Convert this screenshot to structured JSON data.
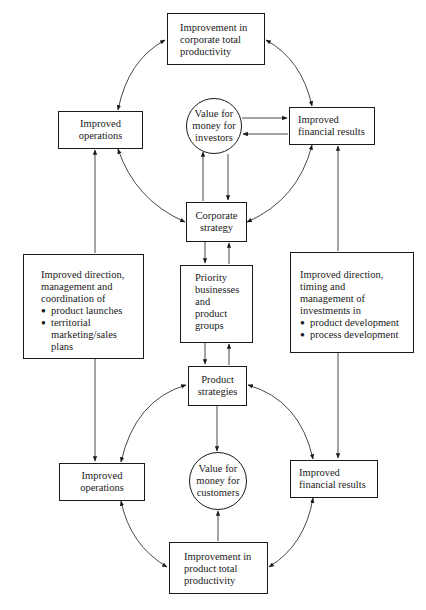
{
  "diagram": {
    "type": "flow-diagram",
    "nodes": {
      "corporate_productivity": {
        "label": "Improvement in\ncorporate total\nproductivity"
      },
      "ops_top": {
        "label": "Improved\noperations"
      },
      "value_investors": {
        "label": "Value for\nmoney for\ninvestors"
      },
      "fin_top": {
        "label": "Improved\nfinancial results"
      },
      "corporate_strategy": {
        "label": "Corporate\nstrategy"
      },
      "left_direction": {
        "label": "Improved direction,\nmanagement and\ncoordination of",
        "bullets": [
          "product launches",
          "territorial\nmarketing/sales\nplans"
        ]
      },
      "priority": {
        "label": "Priority\nbusinesses\nand\nproduct\ngroups"
      },
      "right_direction": {
        "label": "Improved direction,\ntiming and\nmanagement of\ninvestments in",
        "bullets": [
          "product development",
          "process development"
        ]
      },
      "product_strategies": {
        "label": "Product\nstrategies"
      },
      "ops_bottom": {
        "label": "Improved\noperations"
      },
      "value_customers": {
        "label": "Value for\nmoney for\ncustomers"
      },
      "fin_bottom": {
        "label": "Improved\nfinancial results"
      },
      "product_productivity": {
        "label": "Improvement in\nproduct total\nproductivity"
      }
    },
    "edges": [
      {
        "from": "corporate_productivity",
        "to": "ops_top",
        "type": "bidirectional-curve"
      },
      {
        "from": "corporate_productivity",
        "to": "fin_top",
        "type": "bidirectional-curve"
      },
      {
        "from": "ops_top",
        "to": "corporate_strategy",
        "type": "bidirectional-curve"
      },
      {
        "from": "fin_top",
        "to": "corporate_strategy",
        "type": "bidirectional-curve"
      },
      {
        "from": "value_investors",
        "to": "fin_top",
        "type": "arrow"
      },
      {
        "from": "fin_top",
        "to": "value_investors",
        "type": "arrow"
      },
      {
        "from": "corporate_strategy",
        "to": "value_investors",
        "type": "arrow"
      },
      {
        "from": "value_investors",
        "to": "corporate_strategy",
        "type": "arrow"
      },
      {
        "from": "corporate_strategy",
        "to": "priority",
        "type": "arrow"
      },
      {
        "from": "priority",
        "to": "corporate_strategy",
        "type": "arrow"
      },
      {
        "from": "priority",
        "to": "product_strategies",
        "type": "arrow"
      },
      {
        "from": "product_strategies",
        "to": "priority",
        "type": "arrow"
      },
      {
        "from": "left_direction",
        "to": "ops_top",
        "type": "arrow"
      },
      {
        "from": "left_direction",
        "to": "ops_bottom",
        "type": "arrow"
      },
      {
        "from": "right_direction",
        "to": "fin_top",
        "type": "arrow"
      },
      {
        "from": "right_direction",
        "to": "fin_bottom",
        "type": "arrow"
      },
      {
        "from": "product_strategies",
        "to": "ops_bottom",
        "type": "bidirectional-curve"
      },
      {
        "from": "product_strategies",
        "to": "fin_bottom",
        "type": "bidirectional-curve"
      },
      {
        "from": "product_strategies",
        "to": "value_customers",
        "type": "arrow"
      },
      {
        "from": "product_productivity",
        "to": "value_customers",
        "type": "arrow"
      },
      {
        "from": "product_productivity",
        "to": "ops_bottom",
        "type": "bidirectional-curve"
      },
      {
        "from": "product_productivity",
        "to": "fin_bottom",
        "type": "bidirectional-curve"
      }
    ]
  }
}
